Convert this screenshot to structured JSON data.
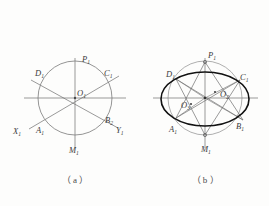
{
  "figure": {
    "background_color": "#fdfdfc",
    "line_color": "#6e6e6e",
    "heavy_line_color": "#1a1a1a",
    "label_color": "#3b3b3b",
    "captions": [
      {
        "id": "caption-a",
        "text": "（ a ）"
      },
      {
        "id": "caption-b",
        "text": "（ b ）"
      }
    ],
    "panel_a": {
      "name": "circle-with-three-diameters",
      "center_label": "O",
      "center_sub": "1",
      "labels": [
        {
          "name": "label-P1",
          "text": "P",
          "sub": "1",
          "x": 82,
          "y": 62
        },
        {
          "name": "label-C1",
          "text": "C",
          "sub": "1",
          "x": 104,
          "y": 76
        },
        {
          "name": "label-D1",
          "text": "D",
          "sub": "1",
          "x": 37,
          "y": 76
        },
        {
          "name": "label-O1",
          "text": "O",
          "sub": "1",
          "x": 76,
          "y": 96
        },
        {
          "name": "label-X1",
          "text": "X",
          "sub": "1",
          "x": 15,
          "y": 133
        },
        {
          "name": "label-A1",
          "text": "A",
          "sub": "1",
          "x": 38,
          "y": 131
        },
        {
          "name": "label-B1",
          "text": "B",
          "sub": "1",
          "x": 105,
          "y": 123
        },
        {
          "name": "label-Y1",
          "text": "Y",
          "sub": "1",
          "x": 118,
          "y": 132
        },
        {
          "name": "label-M1",
          "text": "M",
          "sub": "1",
          "x": 70,
          "y": 152
        }
      ]
    },
    "panel_b": {
      "name": "four-center-ellipse",
      "labels": [
        {
          "name": "label-P1",
          "text": "P",
          "sub": "1",
          "x": 210,
          "y": 61
        },
        {
          "name": "label-C1",
          "text": "C",
          "sub": "1",
          "x": 239,
          "y": 80
        },
        {
          "name": "label-D1",
          "text": "D",
          "sub": "1",
          "x": 168,
          "y": 78
        },
        {
          "name": "label-O2",
          "text": "O",
          "sub": "2",
          "x": 221,
          "y": 96
        },
        {
          "name": "label-O3",
          "text": "O",
          "sub": "3",
          "x": 184,
          "y": 107
        },
        {
          "name": "label-A1",
          "text": "A",
          "sub": "1",
          "x": 171,
          "y": 131
        },
        {
          "name": "label-B1",
          "text": "B",
          "sub": "1",
          "x": 236,
          "y": 128
        },
        {
          "name": "label-M1",
          "text": "M",
          "sub": "1",
          "x": 203,
          "y": 150
        }
      ]
    }
  }
}
